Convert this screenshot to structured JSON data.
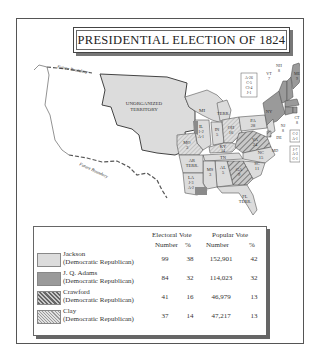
{
  "title": "PRESIDENTIAL ELECTION OF 1824",
  "map": {
    "boundary_label": "Future Boundary",
    "territories": [
      {
        "name": "UNORGANIZED TERRITORY",
        "line2": "TERRITORY",
        "line1": "UNORGANIZED"
      },
      {
        "name": "MI TERR.",
        "label": "MI",
        "label2": "TERR."
      },
      {
        "name": "AR TERR.",
        "label": "AR",
        "label2": "TERR."
      },
      {
        "name": "FL TERR.",
        "label": "FL",
        "label2": "TERR."
      }
    ],
    "states": [
      {
        "abbr": "ME",
        "votes": "9"
      },
      {
        "abbr": "NH",
        "votes": "8"
      },
      {
        "abbr": "VT",
        "votes": "7"
      },
      {
        "abbr": "MA",
        "votes": "15"
      },
      {
        "abbr": "RI",
        "votes": "4"
      },
      {
        "abbr": "CT",
        "votes": "8"
      },
      {
        "abbr": "NY",
        "votes": ""
      },
      {
        "abbr": "NJ",
        "votes": "8"
      },
      {
        "abbr": "PA",
        "votes": "28"
      },
      {
        "abbr": "DE",
        "votes": ""
      },
      {
        "abbr": "MD",
        "votes": ""
      },
      {
        "abbr": "VA",
        "votes": "24"
      },
      {
        "abbr": "NC",
        "votes": "15"
      },
      {
        "abbr": "SC",
        "votes": "11"
      },
      {
        "abbr": "GA",
        "votes": "9"
      },
      {
        "abbr": "OH",
        "votes": "16"
      },
      {
        "abbr": "IN",
        "votes": "5"
      },
      {
        "abbr": "IL",
        "votes": "1-2",
        "votes2": "A-1"
      },
      {
        "abbr": "KY",
        "votes": "14"
      },
      {
        "abbr": "TN",
        "votes": "11"
      },
      {
        "abbr": "AL",
        "votes": "5"
      },
      {
        "abbr": "MS",
        "votes": "3"
      },
      {
        "abbr": "LA",
        "votes": "J-3",
        "votes2": "A-2"
      },
      {
        "abbr": "MO",
        "votes": "3"
      }
    ],
    "ny_split": [
      "A-26",
      "C-5",
      "Cl-4",
      "J-1"
    ],
    "de_split": [
      "C-2",
      "A-1"
    ],
    "md_split": [
      "J-7",
      "A-3",
      "C-1"
    ]
  },
  "legend": {
    "electoral_header": "Electoral Vote",
    "popular_header": "Popular Vote",
    "col_number": "Number",
    "col_percent": "%",
    "rows": [
      {
        "name": "Jackson",
        "party": "(Democratic Republican)",
        "ev": "99",
        "ev_pct": "38",
        "pv": "152,901",
        "pv_pct": "42",
        "color": "#d9d9d9",
        "pattern": "solid"
      },
      {
        "name": "J. Q. Adams",
        "party": "(Democratic Republican)",
        "ev": "84",
        "ev_pct": "32",
        "pv": "114,023",
        "pv_pct": "32",
        "color": "#9a9a9a",
        "pattern": "solid"
      },
      {
        "name": "Crawford",
        "party": "(Democratic Republican)",
        "ev": "41",
        "ev_pct": "16",
        "pv": "46,979",
        "pv_pct": "13",
        "color": "#8a8a8a",
        "pattern": "dense-hatch"
      },
      {
        "name": "Clay",
        "party": "(Democratic Republican)",
        "ev": "37",
        "ev_pct": "14",
        "pv": "47,217",
        "pv_pct": "13",
        "color": "#b5b5b5",
        "pattern": "light-hatch"
      }
    ]
  }
}
